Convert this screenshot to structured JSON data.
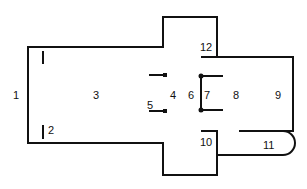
{
  "diagram": {
    "type": "floor-plan",
    "labels": [
      {
        "id": "1",
        "text": "1",
        "x": 13,
        "y": 99
      },
      {
        "id": "2",
        "text": "2",
        "x": 48,
        "y": 134
      },
      {
        "id": "3",
        "text": "3",
        "x": 93,
        "y": 99
      },
      {
        "id": "4",
        "text": "4",
        "x": 170,
        "y": 99
      },
      {
        "id": "5",
        "text": "5",
        "x": 147,
        "y": 109
      },
      {
        "id": "6",
        "text": "6",
        "x": 188,
        "y": 99
      },
      {
        "id": "7",
        "text": "7",
        "x": 204,
        "y": 99
      },
      {
        "id": "8",
        "text": "8",
        "x": 233,
        "y": 99
      },
      {
        "id": "9",
        "text": "9",
        "x": 275,
        "y": 99
      },
      {
        "id": "10",
        "text": "10",
        "x": 200,
        "y": 146
      },
      {
        "id": "11",
        "text": "11",
        "x": 263,
        "y": 149
      },
      {
        "id": "12",
        "text": "12",
        "x": 200,
        "y": 51
      }
    ]
  }
}
